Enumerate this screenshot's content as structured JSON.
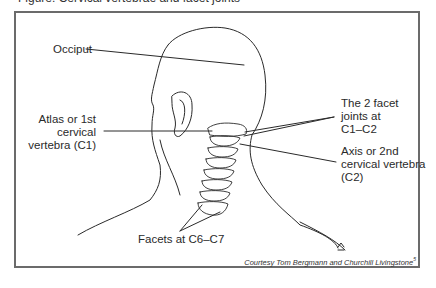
{
  "figure": {
    "title_fragment": "Figure: Cervical vertebrae and facet joints",
    "labels": {
      "occiput": "Occiput",
      "atlas_line1": "Atlas or 1st",
      "atlas_line2": "cervical",
      "atlas_line3": "vertebra (C1)",
      "facet_joints_line1": "The 2 facet",
      "facet_joints_line2": "joints at",
      "facet_joints_line3": "C1–C2",
      "axis_line1": "Axis or 2nd",
      "axis_line2": "cervical vertebra",
      "axis_line3": "(C2)",
      "facets_c6c7": "Facets at C6–C7"
    },
    "credit": "Courtesy Tom Bergmann and Churchill Livingstone",
    "credit_ref": "5",
    "colors": {
      "frame": "#6b6b6b",
      "line": "#2a2a2a",
      "background": "#ffffff"
    }
  }
}
